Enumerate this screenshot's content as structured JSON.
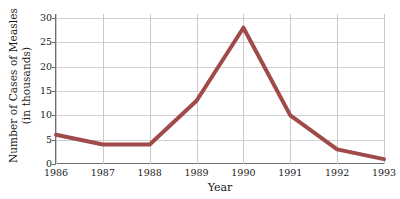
{
  "chart_data": {
    "type": "line",
    "title": "",
    "xlabel": "Year",
    "ylabel_line1": "Number of Cases of Measles",
    "ylabel_line2": "(in thousands)",
    "categories": [
      "1986",
      "1987",
      "1988",
      "1989",
      "1990",
      "1991",
      "1992",
      "1993"
    ],
    "values": [
      6,
      4,
      4,
      13,
      28,
      10,
      3,
      1
    ],
    "series": [
      {
        "name": "Cases of Measles",
        "values": [
          6,
          4,
          4,
          13,
          28,
          10,
          3,
          1
        ]
      }
    ],
    "y_ticks": [
      0,
      5,
      10,
      15,
      20,
      25,
      30
    ],
    "ylim": [
      0,
      30
    ],
    "xlim": [
      "1986",
      "1993"
    ],
    "grid": true,
    "legend": "none",
    "line_color": "#a04a4a",
    "grid_color": "#cfcfcf",
    "axis_color": "#6f6f6f",
    "background_color": "#ffffff"
  }
}
